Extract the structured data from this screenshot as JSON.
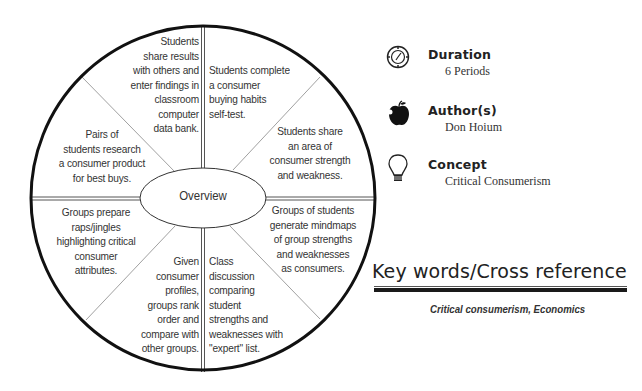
{
  "diagram": {
    "center_label": "Overview",
    "segments": [
      {
        "position": "top-left",
        "text": "Students\nshare results\nwith others and\nenter findings in\nclassroom\ncomputer\ndata bank."
      },
      {
        "position": "top-right",
        "text": "Students complete\na consumer\nbuying habits\nself-test."
      },
      {
        "position": "right-upper",
        "text": "Students share\nan area of\nconsumer strength\nand weakness."
      },
      {
        "position": "right-lower",
        "text": "Groups of students\ngenerate mindmaps\nof group strengths\nand weaknesses\nas consumers."
      },
      {
        "position": "bottom-right",
        "text": "Class\ndiscussion\ncomparing\nstudent\nstrengths and\nweaknesses with\n\"expert\" list."
      },
      {
        "position": "bottom-left",
        "text": "Given\nconsumer\nprofiles,\ngroups rank\norder and\ncompare with\nother groups."
      },
      {
        "position": "left-lower",
        "text": "Groups prepare\nraps/jingles\nhighlighting critical\nconsumer\nattributes."
      },
      {
        "position": "left-upper",
        "text": "Pairs of\nstudents research\na consumer product\nfor best buys."
      }
    ]
  },
  "info": [
    {
      "icon": "clock-icon",
      "title": "Duration",
      "value": "6 Periods"
    },
    {
      "icon": "apple-icon",
      "title": "Author(s)",
      "value": "Don Hoium"
    },
    {
      "icon": "lightbulb-icon",
      "title": "Concept",
      "value": "Critical Consumerism"
    }
  ],
  "keywords": {
    "title": "Key words/Cross reference",
    "list": "Critical consumerism, Economics"
  }
}
